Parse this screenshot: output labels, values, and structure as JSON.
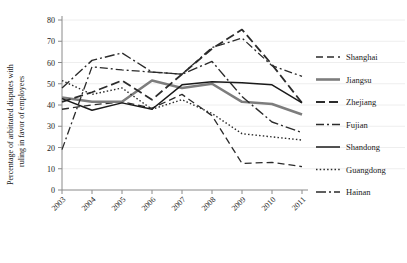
{
  "chart_data": {
    "type": "line",
    "title": "",
    "xlabel": "",
    "ylabel": "Percentage of arbitrated disputes with ruling in favor of employees",
    "categories": [
      "2003",
      "2004",
      "2005",
      "2006",
      "2007",
      "2008",
      "2009",
      "2010",
      "2011"
    ],
    "x": [
      2003,
      2004,
      2005,
      2006,
      2007,
      2008,
      2009,
      2010,
      2011
    ],
    "ylim": [
      0,
      80
    ],
    "yticks": [
      0,
      10,
      20,
      30,
      40,
      50,
      60,
      70,
      80
    ],
    "grid": true,
    "legend_position": "right",
    "series": [
      {
        "name": "Shanghai",
        "values": [
          38.0,
          40.0,
          41.5,
          38.5,
          45.0,
          35.0,
          12.5,
          13.0,
          11.0
        ],
        "style": "dashed",
        "color": "#2b2b2b",
        "width": 1.3,
        "dash": "7,4"
      },
      {
        "name": "Jiangsu",
        "values": [
          43.5,
          41.5,
          41.5,
          51.5,
          48.0,
          50.0,
          41.5,
          40.5,
          35.5
        ],
        "style": "solid-thick",
        "color": "#7d7d7d",
        "width": 2.6,
        "dash": ""
      },
      {
        "name": "Zhejiang",
        "values": [
          41.5,
          46.0,
          51.5,
          42.5,
          54.5,
          66.5,
          75.5,
          59.0,
          41.0
        ],
        "style": "long-dash",
        "color": "#2b2b2b",
        "width": 1.8,
        "dash": "9,4"
      },
      {
        "name": "Fujian",
        "values": [
          19.0,
          58.0,
          56.5,
          55.5,
          54.5,
          67.0,
          71.5,
          58.5,
          53.5
        ],
        "style": "dash-dot",
        "color": "#2b2b2b",
        "width": 1.3,
        "dash": "8,3,2,3"
      },
      {
        "name": "Shandong",
        "values": [
          43.0,
          37.5,
          41.0,
          38.0,
          49.5,
          51.0,
          50.5,
          49.5,
          41.0
        ],
        "style": "solid",
        "color": "#1a1a1a",
        "width": 1.5,
        "dash": ""
      },
      {
        "name": "Guangdong",
        "values": [
          51.5,
          45.0,
          48.0,
          38.0,
          42.5,
          36.0,
          26.5,
          25.0,
          23.5
        ],
        "style": "dotted",
        "color": "#2b2b2b",
        "width": 1.4,
        "dash": "1.5,2.2"
      },
      {
        "name": "Hainan",
        "values": [
          48.0,
          61.0,
          64.5,
          55.5,
          54.5,
          60.5,
          44.0,
          32.0,
          27.0
        ],
        "style": "dash-dot-dot",
        "color": "#2b2b2b",
        "width": 1.4,
        "dash": "10,3,2,3"
      }
    ]
  },
  "legend": {
    "items": [
      {
        "label": "Shanghai"
      },
      {
        "label": "Jiangsu"
      },
      {
        "label": "Zhejiang"
      },
      {
        "label": "Fujian"
      },
      {
        "label": "Shandong"
      },
      {
        "label": "Guangdong"
      },
      {
        "label": "Hainan"
      }
    ]
  },
  "axes": {
    "y_label_line1": "Percentage of arbitrated disputes with",
    "y_label_line2": "ruling in favor of employees"
  }
}
